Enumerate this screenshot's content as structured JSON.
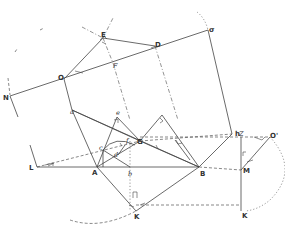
{
  "diagram": {
    "type": "geometric-construction",
    "labels": {
      "N": "N",
      "O": "O",
      "F": "F",
      "D": "D",
      "sigma": "σ",
      "E": "E",
      "lambda": "λ",
      "a": "a",
      "e": "e",
      "h": "h",
      "G": "G",
      "f": "f",
      "c": "c",
      "d": "d",
      "L": "L",
      "A": "A",
      "b": "b",
      "B": "B",
      "K": "K",
      "Z": "Z",
      "O_prime": "O'",
      "M": "M",
      "K_prime": "K"
    },
    "points": {
      "N": [
        8,
        96
      ],
      "O": [
        64,
        79
      ],
      "F": [
        113,
        63
      ],
      "D": [
        155,
        46
      ],
      "sigma": [
        208,
        30
      ],
      "E": [
        103,
        38
      ],
      "a": [
        72,
        110
      ],
      "e": [
        117,
        137
      ],
      "h": [
        232,
        134
      ],
      "G": [
        140,
        141
      ],
      "f": [
        125,
        145
      ],
      "c": [
        103,
        150
      ],
      "d": [
        118,
        155
      ],
      "L": [
        37,
        167
      ],
      "A": [
        97,
        167
      ],
      "b": [
        130,
        167
      ],
      "B": [
        199,
        167
      ],
      "K": [
        136,
        211
      ],
      "Z": [
        242,
        137
      ],
      "O_prime": [
        270,
        137
      ],
      "M": [
        241,
        170
      ],
      "K_prime": [
        241,
        211
      ]
    }
  }
}
